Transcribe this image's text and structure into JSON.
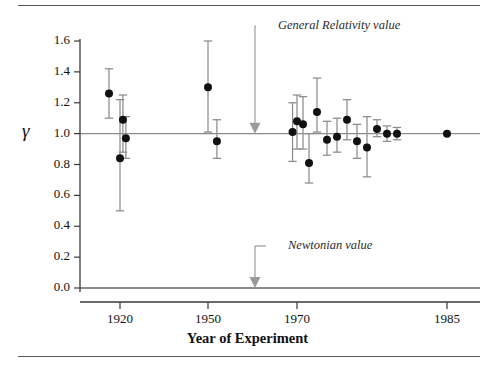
{
  "figure": {
    "y_axis_symbol": "γ",
    "x_axis_title": "Year of Experiment",
    "frame_color": "#5a5a5a",
    "point_color": "#111111",
    "errorbar_color": "#8c8c8c",
    "reference_line_color": "#8c8c8c",
    "annotation_color": "#9a9a9a"
  },
  "chart_data": {
    "type": "scatter",
    "title": "",
    "xlabel": "Year of Experiment",
    "ylabel": "γ",
    "grid": false,
    "legend": "none",
    "ylim": [
      0.0,
      1.6
    ],
    "yticks": [
      0.0,
      0.2,
      0.4,
      0.6,
      0.8,
      1.0,
      1.2,
      1.4,
      1.6
    ],
    "ytick_labels": [
      "0.0",
      "0.2",
      "0.4",
      "0.6",
      "0.8",
      "1.0",
      "1.2",
      "1.4",
      "1.6"
    ],
    "xticks": [
      1920,
      1950,
      1970,
      1985
    ],
    "xtick_labels": [
      "1920",
      "1950",
      "1970",
      "1985"
    ],
    "x_axis_note": "non-linear / compressed scale; tick pixel anchors 1920,1950,1970,1985",
    "reference_lines": [
      {
        "name": "General Relativity value",
        "y": 1.0
      },
      {
        "name": "Newtonian value",
        "y": 0.0
      }
    ],
    "annotations": [
      {
        "text": "General Relativity value",
        "points_to_y": 1.0,
        "arrow": "down"
      },
      {
        "text": "Newtonian value",
        "points_to_y": 0.0,
        "arrow": "down"
      }
    ],
    "points": [
      {
        "x": 1919.0,
        "y": 1.26,
        "ylow": 1.1,
        "yhigh": 1.42
      },
      {
        "x": 1920.0,
        "y": 0.84,
        "ylow": 0.5,
        "yhigh": 1.22
      },
      {
        "x": 1921.0,
        "y": 1.09,
        "ylow": 0.88,
        "yhigh": 1.25
      },
      {
        "x": 1922.0,
        "y": 0.97,
        "ylow": 0.84,
        "yhigh": 1.11
      },
      {
        "x": 1950.0,
        "y": 1.3,
        "ylow": 1.01,
        "yhigh": 1.6
      },
      {
        "x": 1952.0,
        "y": 0.95,
        "ylow": 0.84,
        "yhigh": 1.09
      },
      {
        "x": 1969.0,
        "y": 1.01,
        "ylow": 0.82,
        "yhigh": 1.2
      },
      {
        "x": 1970.0,
        "y": 1.08,
        "ylow": 0.9,
        "yhigh": 1.25
      },
      {
        "x": 1970.6,
        "y": 1.06,
        "ylow": 0.9,
        "yhigh": 1.24
      },
      {
        "x": 1971.2,
        "y": 0.81,
        "ylow": 0.68,
        "yhigh": 1.0
      },
      {
        "x": 1972.0,
        "y": 1.14,
        "ylow": 1.01,
        "yhigh": 1.36
      },
      {
        "x": 1973.0,
        "y": 0.96,
        "ylow": 0.86,
        "yhigh": 1.08
      },
      {
        "x": 1974.0,
        "y": 0.98,
        "ylow": 0.88,
        "yhigh": 1.1
      },
      {
        "x": 1975.0,
        "y": 1.09,
        "ylow": 0.96,
        "yhigh": 1.22
      },
      {
        "x": 1976.0,
        "y": 0.95,
        "ylow": 0.84,
        "yhigh": 1.06
      },
      {
        "x": 1977.0,
        "y": 0.91,
        "ylow": 0.72,
        "yhigh": 1.11
      },
      {
        "x": 1978.0,
        "y": 1.03,
        "ylow": 0.98,
        "yhigh": 1.09
      },
      {
        "x": 1979.0,
        "y": 1.0,
        "ylow": 0.95,
        "yhigh": 1.05
      },
      {
        "x": 1980.0,
        "y": 1.0,
        "ylow": 0.96,
        "yhigh": 1.04
      },
      {
        "x": 1985.0,
        "y": 1.0,
        "ylow": 1.0,
        "yhigh": 1.0
      }
    ]
  }
}
